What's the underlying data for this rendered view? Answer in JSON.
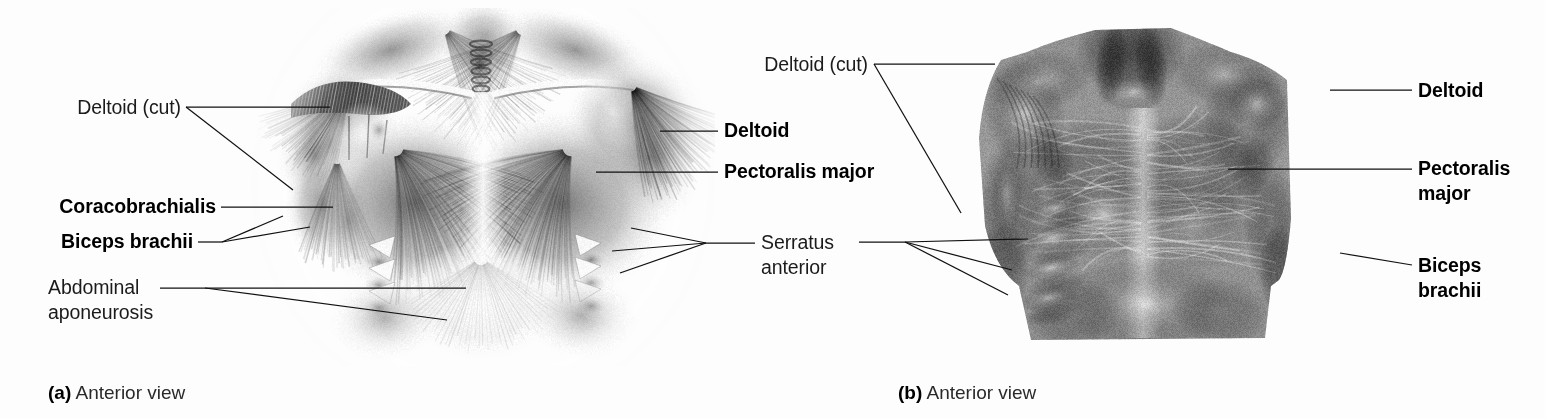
{
  "figure": {
    "background": "#fdfdfd",
    "line_color": "#111111",
    "text_color": "#1b1b1b"
  },
  "panel_a": {
    "caption_marker": "(a)",
    "caption_text": " Anterior view",
    "image_kind": "grayscale-anatomical-illustration",
    "image_subject": "anterior view of superficial chest and shoulder muscles, airbrush illustration",
    "labels": [
      {
        "id": "deltoid-cut",
        "text": "Deltoid (cut)",
        "weight": "regular",
        "align": "right",
        "lines": [
          "Deltoid (cut)"
        ]
      },
      {
        "id": "coracobrachialis",
        "text": "Coracobrachialis",
        "weight": "bold",
        "align": "right",
        "lines": [
          "Coracobrachialis"
        ]
      },
      {
        "id": "biceps-brachii",
        "text": "Biceps brachii",
        "weight": "bold",
        "align": "right",
        "lines": [
          "Biceps brachii"
        ]
      },
      {
        "id": "abdominal-aponeurosis",
        "text": "Abdominal aponeurosis",
        "weight": "regular",
        "align": "left",
        "lines": [
          "Abdominal",
          "aponeurosis"
        ]
      },
      {
        "id": "deltoid",
        "text": "Deltoid",
        "weight": "bold",
        "align": "left",
        "lines": [
          "Deltoid"
        ]
      },
      {
        "id": "pectoralis-major",
        "text": "Pectoralis major",
        "weight": "bold",
        "align": "left",
        "lines": [
          "Pectoralis major"
        ]
      },
      {
        "id": "serratus-anterior",
        "text": "Serratus anterior",
        "weight": "regular",
        "align": "left",
        "lines": [
          "Serratus",
          "anterior"
        ]
      }
    ]
  },
  "panel_b": {
    "caption_marker": "(b)",
    "caption_text": " Anterior view",
    "image_kind": "grayscale-cadaver-photograph",
    "image_subject": "anterior view of dissected human thorax showing pectoralis major, deltoid and biceps brachii",
    "labels": [
      {
        "id": "deltoid-cut-b",
        "text": "Deltoid (cut)",
        "weight": "regular",
        "align": "right",
        "lines": [
          "Deltoid (cut)"
        ]
      },
      {
        "id": "deltoid-b",
        "text": "Deltoid",
        "weight": "bold",
        "align": "left",
        "lines": [
          "Deltoid"
        ]
      },
      {
        "id": "pectoralis-major-b",
        "text": "Pectoralis major",
        "weight": "bold",
        "align": "left",
        "lines": [
          "Pectoralis",
          "major"
        ]
      },
      {
        "id": "biceps-brachii-b",
        "text": "Biceps brachii",
        "weight": "bold",
        "align": "left",
        "lines": [
          "Biceps",
          "brachii"
        ]
      }
    ]
  }
}
